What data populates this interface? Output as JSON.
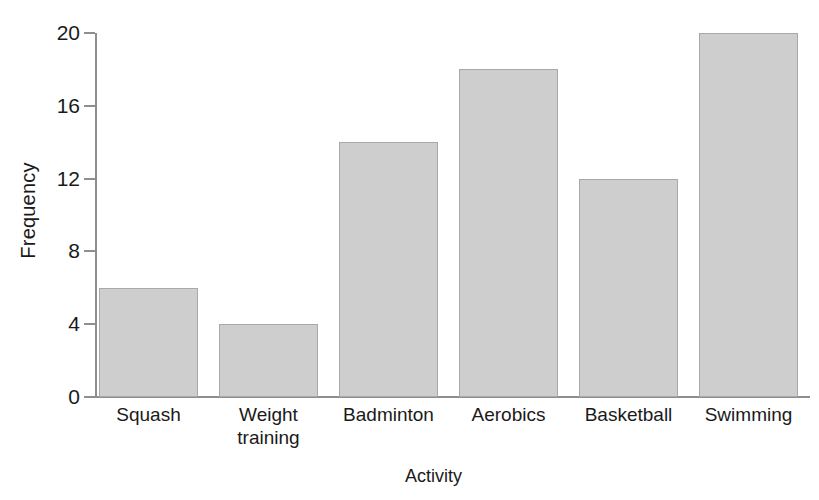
{
  "chart_data": {
    "type": "bar",
    "title": "",
    "xlabel": "Activity",
    "ylabel": "Frequency",
    "categories": [
      "Squash",
      "Weight training",
      "Badminton",
      "Aerobics",
      "Basketball",
      "Swimming"
    ],
    "values": [
      6,
      4,
      14,
      18,
      12,
      20
    ],
    "ylim": [
      0,
      20
    ],
    "yticks": [
      0,
      4,
      8,
      12,
      16,
      20
    ],
    "ytick_labels": [
      "0",
      "4",
      "8",
      "12",
      "16",
      "20"
    ],
    "grid": false,
    "legend": false,
    "bar_fill_color": "#cecece",
    "bar_border_color": "#a9a9a9",
    "axis_color": "#8e8e8e",
    "text_color": "#1a1a1a",
    "background_color": "#ffffff"
  },
  "axes": {
    "y_title": "Frequency",
    "x_title": "Activity"
  },
  "x_labels": [
    "Squash",
    "Weight\ntraining",
    "Badminton",
    "Aerobics",
    "Basketball",
    "Swimming"
  ]
}
